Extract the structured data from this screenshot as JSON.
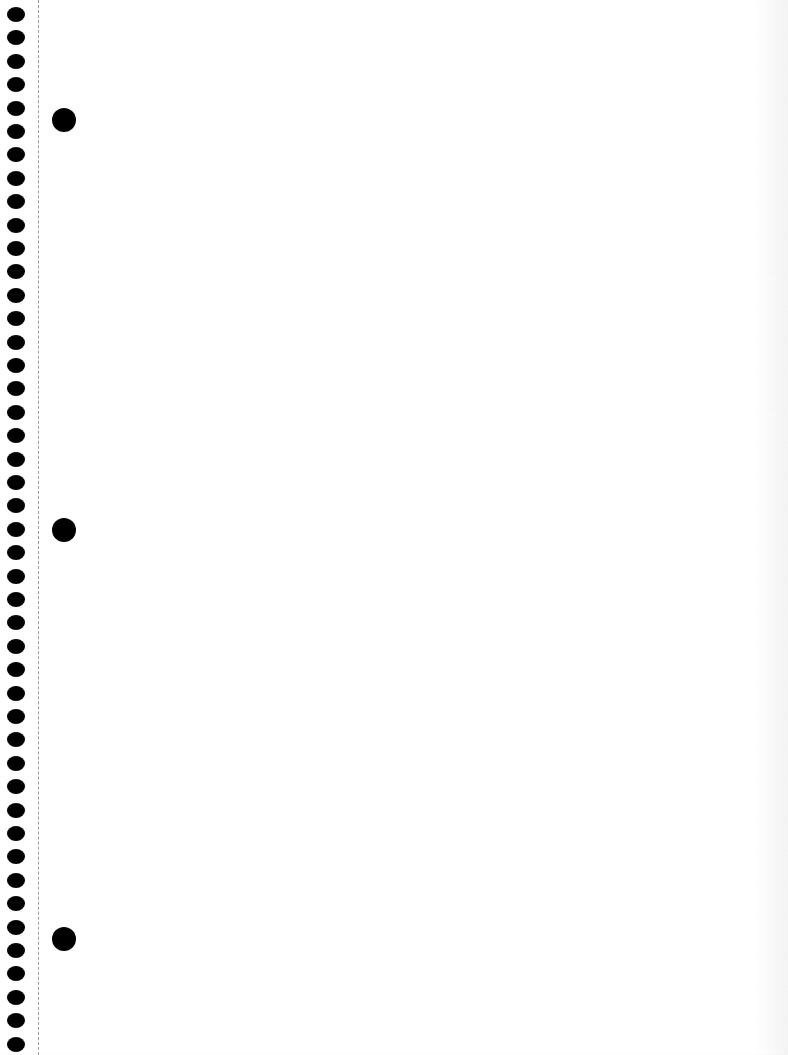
{
  "page": {
    "type": "blank-notebook-sheet",
    "background_color": "#ffffff",
    "spiral_hole_color": "#000000",
    "perforation_color": "#9a9a9a"
  },
  "spiral": {
    "count": 45,
    "start_y": 7,
    "spacing": 23.4
  },
  "binder_holes": [
    {
      "x": 52,
      "y": 108
    },
    {
      "x": 52,
      "y": 518
    },
    {
      "x": 52,
      "y": 927
    }
  ]
}
